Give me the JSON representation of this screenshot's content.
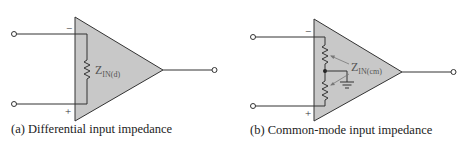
{
  "diagrams": [
    {
      "id": "a",
      "caption": "(a) Differential input impedance",
      "inverting_sign": "−",
      "noninverting_sign": "+",
      "impedance_label": "Z",
      "impedance_subscript": "IN(d)"
    },
    {
      "id": "b",
      "caption": "(b) Common-mode input impedance",
      "inverting_sign": "−",
      "noninverting_sign": "+",
      "impedance_label": "Z",
      "impedance_subscript": "IN(cm)"
    }
  ],
  "colors": {
    "opamp_fill": "#c8c8c8",
    "line": "#333333"
  }
}
